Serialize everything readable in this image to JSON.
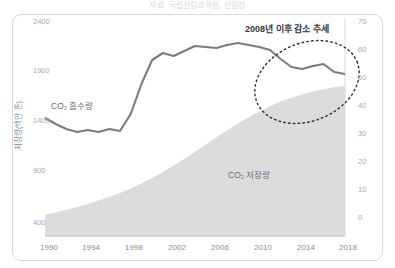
{
  "top_caption": "자료: 국립산림과학원, 산림청",
  "chart_data": {
    "type": "area",
    "title": "",
    "xlabel": "",
    "ylabel": "저장량(백만 톤)",
    "ylabel_right": "",
    "x": [
      1990,
      1991,
      1992,
      1993,
      1994,
      1995,
      1996,
      1997,
      1998,
      1999,
      2000,
      2001,
      2002,
      2003,
      2004,
      2005,
      2006,
      2007,
      2008,
      2009,
      2010,
      2011,
      2012,
      2013,
      2014,
      2015,
      2016,
      2017,
      2018
    ],
    "xticks": [
      "1990",
      "1994",
      "1998",
      "2002",
      "2006",
      "2010",
      "2014",
      "2018"
    ],
    "xlim": [
      1990,
      2018
    ],
    "yticks_left": [
      "2400",
      "1900",
      "1400",
      "900",
      "400"
    ],
    "ylim_left": [
      400,
      2400
    ],
    "yticks_right": [
      "70",
      "60",
      "50",
      "40",
      "30",
      "20",
      "10",
      "0"
    ],
    "ylim_right": [
      0,
      70
    ],
    "grid": false,
    "legend": "none",
    "series": [
      {
        "name": "CO₂ 흡수량",
        "name_plain": "CO2 흡수량",
        "axis": "left",
        "type": "line",
        "color": "#7c7c80",
        "values": [
          1440,
          1380,
          1330,
          1300,
          1320,
          1300,
          1330,
          1310,
          1480,
          1780,
          2020,
          2090,
          2060,
          2110,
          2160,
          2150,
          2140,
          2170,
          2190,
          2170,
          2150,
          2120,
          2030,
          1950,
          1930,
          1960,
          1980,
          1900,
          1880
        ]
      },
      {
        "name": "CO₂ 저장량",
        "name_plain": "CO2 저장량",
        "axis": "right",
        "type": "area",
        "color": "#dcdcdc",
        "values": [
          1.2,
          2.0,
          2.9,
          3.9,
          5.0,
          6.2,
          7.5,
          8.9,
          10.5,
          12.3,
          14.3,
          16.4,
          18.7,
          21.1,
          23.6,
          26.2,
          28.8,
          31.3,
          33.7,
          36.0,
          38.1,
          40.0,
          41.6,
          43.0,
          44.2,
          45.2,
          46.0,
          46.7,
          47.2
        ]
      }
    ],
    "annotations": [
      {
        "name": "decline-trend-note",
        "text": "2008년 이후 감소 추세",
        "x": 2008,
        "shape": "ellipse"
      }
    ],
    "inline_labels": [
      {
        "name": "absorption-label",
        "text": "CO₂ 흡수량"
      },
      {
        "name": "storage-label",
        "text": "CO₂ 저장량"
      }
    ]
  },
  "colors": {
    "line": "#7c7c80",
    "area": "#dcdcdc",
    "frame": "#d9d9dc",
    "axis": "#b9b9bd",
    "tick_text": "#a9a9ae",
    "annotation": "#3a3a3c"
  }
}
